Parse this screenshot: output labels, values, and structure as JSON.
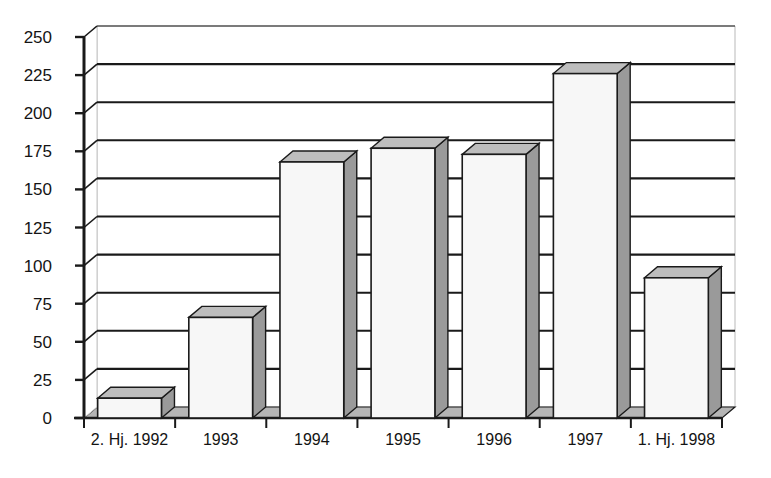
{
  "chart_data": {
    "type": "bar",
    "title": "",
    "subtitle": "",
    "xlabel": "",
    "ylabel": "",
    "categories": [
      "2. Hj. 1992",
      "1993",
      "1994",
      "1995",
      "1996",
      "1997",
      "1. Hj. 1998"
    ],
    "values": [
      13,
      66,
      168,
      177,
      173,
      226,
      92
    ],
    "series": [
      {
        "name": "",
        "values": [
          13,
          66,
          168,
          177,
          173,
          226,
          92
        ]
      }
    ],
    "ylim": [
      0,
      250
    ],
    "yticks": [
      0,
      25,
      50,
      75,
      100,
      125,
      150,
      175,
      200,
      225,
      250
    ],
    "ytick_labels": [
      "0",
      "25",
      "50",
      "75",
      "100",
      "125",
      "150",
      "175",
      "200",
      "225",
      "250"
    ],
    "grid": true,
    "grid_axis": "y",
    "legend": false,
    "legend_position": "none",
    "style": "3d-column",
    "colors": {
      "bar_face": "#f7f7f7",
      "bar_side": "#9a9a9a",
      "bar_top": "#bdbdbd",
      "bar_outline": "#1a1a1a",
      "gridline": "#1a1a1a",
      "axis": "#1a1a1a",
      "floor": "#b5b5b5",
      "back_wall": "#ffffff",
      "text": "#141414",
      "background": "#ffffff"
    }
  },
  "axes": {
    "y_tick_labels": [
      "250",
      "225",
      "200",
      "175",
      "150",
      "125",
      "100",
      "75",
      "50",
      "25",
      "0"
    ],
    "x_tick_labels": [
      "2. Hj. 1992",
      "1993",
      "1994",
      "1995",
      "1996",
      "1997",
      "1. Hj. 1998"
    ]
  }
}
